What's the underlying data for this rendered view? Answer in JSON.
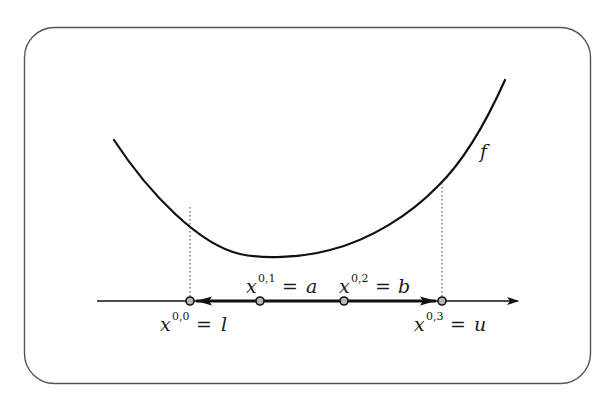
{
  "figure": {
    "function_label": "f",
    "points": [
      {
        "base": "x",
        "sup": "0,0",
        "eq": "=",
        "rhs": "l",
        "label_side": "below",
        "order": 0
      },
      {
        "base": "x",
        "sup": "0,1",
        "eq": "=",
        "rhs": "a",
        "label_side": "above",
        "order": 1
      },
      {
        "base": "x",
        "sup": "0,2",
        "eq": "=",
        "rhs": "b",
        "label_side": "above",
        "order": 2
      },
      {
        "base": "x",
        "sup": "0,3",
        "eq": "=",
        "rhs": "u",
        "label_side": "below",
        "order": 3
      }
    ],
    "colors": {
      "stroke": "#111111",
      "border": "#555555",
      "point_fill": "#b8b8b8",
      "background": "#ffffff"
    }
  }
}
